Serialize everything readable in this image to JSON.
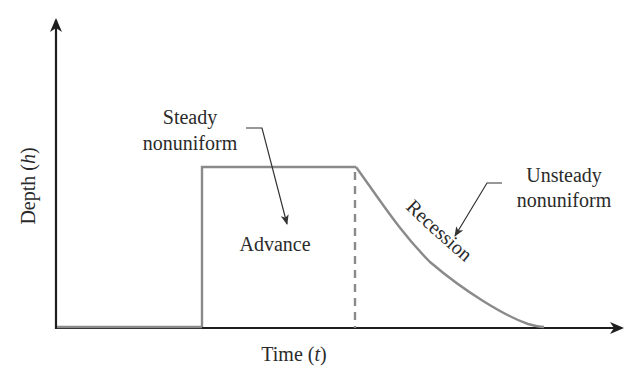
{
  "figure": {
    "type": "infiltration-hydrograph-schematic",
    "axes": {
      "x_label_main": "Time (",
      "x_label_var": "t",
      "x_label_close": ")",
      "y_label_main": "Depth (",
      "y_label_var": "h",
      "y_label_close": ")"
    },
    "phases": {
      "advance": "Advance",
      "recession": "Recession"
    },
    "annotations": {
      "steady_line1": "Steady",
      "steady_line2": "nonuniform",
      "unsteady_line1": "Unsteady",
      "unsteady_line2": "nonuniform"
    },
    "colors": {
      "axis": "#1e1e1e",
      "hydrograph": "#8a8a8a",
      "text": "#2a2a2a",
      "background": "#ffffff"
    }
  }
}
